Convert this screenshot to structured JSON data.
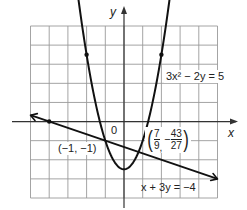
{
  "chart_data": {
    "type": "line",
    "title": "",
    "xlabel": "x",
    "ylabel": "y",
    "origin_label": "0",
    "xlim": [
      -5,
      5
    ],
    "ylim": [
      -4,
      5
    ],
    "grid": true,
    "grid_step": 1,
    "series": [
      {
        "name": "3x² − 2y = 5",
        "kind": "parabola",
        "equation": "y = (3x^2 - 5) / 2",
        "x_range": [
          -2.6,
          2.6
        ],
        "marked_points": [
          [
            -2,
            3.5
          ],
          [
            2,
            3.5
          ]
        ],
        "vertex": [
          0,
          -2.5
        ]
      },
      {
        "name": "x + 3y = −4",
        "kind": "line",
        "equation": "y = (-4 - x) / 3",
        "x_range": [
          -5,
          5
        ],
        "marked_points": [
          [
            -4,
            0
          ]
        ]
      }
    ],
    "annotations": [
      {
        "text": "(−1, −1)",
        "point": [
          -1,
          -1
        ]
      },
      {
        "text": "(7/9, −43/27)",
        "point": [
          0.7778,
          -1.5926
        ]
      }
    ]
  },
  "labels": {
    "y_axis": "y",
    "x_axis": "x",
    "origin": "0",
    "parabola_eq": "3x² − 2y = 5",
    "line_eq": "x + 3y = −4",
    "point1": "(−1, −1)",
    "point2": {
      "open": "(",
      "x_num": "7",
      "x_den": "9",
      "comma": ",",
      "sign": "−",
      "y_num": "43",
      "y_den": "27",
      "close": ")"
    }
  },
  "style": {
    "grid_color": "#9a9a9a",
    "axis_color": "#333333",
    "curve_color": "#111111"
  }
}
